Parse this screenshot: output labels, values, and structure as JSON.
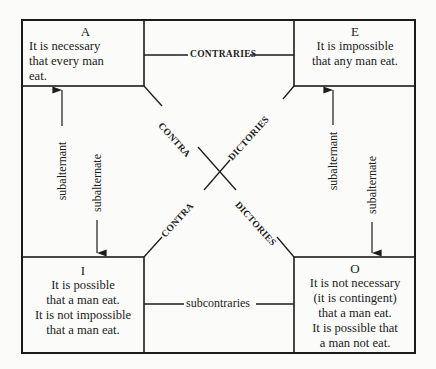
{
  "diagram": {
    "boxes": {
      "A": {
        "letter": "A",
        "lines": [
          "It is necessary",
          "that every man",
          "eat."
        ]
      },
      "E": {
        "letter": "E",
        "lines": [
          "It is impossible",
          "that any man eat."
        ]
      },
      "I": {
        "letter": "I",
        "lines": [
          "It is possible",
          "that a man eat.",
          "It is not impossible",
          "that a man eat."
        ]
      },
      "O": {
        "letter": "O",
        "lines": [
          "It is not necessary",
          "(it is contingent)",
          "that a man eat.",
          "It is possible that",
          "a man not eat."
        ]
      }
    },
    "relations": {
      "contraries": "CONTRARIES",
      "subcontraries": "subcontraries",
      "contradictories_a_o": [
        "CONTRA",
        "DICTORIES"
      ],
      "contradictories_e_i": [
        "CONTRA",
        "DICTORIES"
      ],
      "left_subalternant": "subalternant",
      "left_subalternate": "subalternate",
      "right_subalternant": "subalternant",
      "right_subalternate": "subalternate"
    },
    "colors": {
      "ink": "#1c1c1c",
      "paper": "#fbfbf9"
    }
  }
}
